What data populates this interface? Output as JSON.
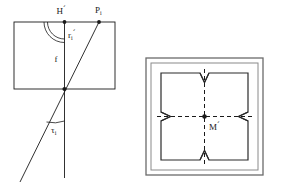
{
  "figure": {
    "background_color": "#ffffff",
    "ink_color": "#1a1a1a",
    "frame_color": "#555555",
    "panels": [
      {
        "id": "left-panel",
        "name": "projection-geometry-panel",
        "labels": {
          "h_prime": "H",
          "h_prime_mark": "´",
          "p_i": "P",
          "p_i_sub": "i",
          "r_i": "r",
          "r_i_sub": "i",
          "r_i_prime": "´",
          "f": "f",
          "tau": "τ",
          "tau_sub": "i"
        },
        "elements": [
          "rectangle-outline",
          "vertical-axis-f",
          "oblique-ray",
          "angle-arc-double-at-h",
          "angle-arc-tau",
          "point-h-prime",
          "point-p-i",
          "point-intersection"
        ]
      },
      {
        "id": "right-panel",
        "name": "square-format-panel",
        "labels": {
          "m_prime": "M",
          "m_prime_mark": "´"
        },
        "elements": [
          "outer-frame",
          "inner-frame",
          "quadrant-square",
          "dashed-vertical-centerline",
          "dashed-horizontal-centerline",
          "notch-top",
          "notch-bottom",
          "notch-left",
          "notch-right",
          "center-point-m"
        ]
      }
    ]
  }
}
